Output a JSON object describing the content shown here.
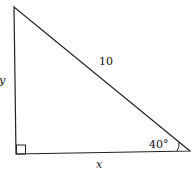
{
  "diagram": {
    "type": "right-triangle",
    "labels": {
      "hypotenuse": "10",
      "vertical_side": "y",
      "horizontal_side": "x",
      "angle": "40°"
    },
    "colors": {
      "stroke": "#222222",
      "background": "#ffffff"
    }
  }
}
